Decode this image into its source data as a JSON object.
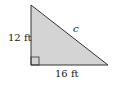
{
  "diagram": {
    "type": "right-triangle",
    "labels": {
      "vertical_leg": "12 ft",
      "horizontal_leg": "16 ft",
      "hypotenuse": "c"
    },
    "colors": {
      "fill": "#d4d4d4",
      "stroke": "#333333"
    }
  }
}
